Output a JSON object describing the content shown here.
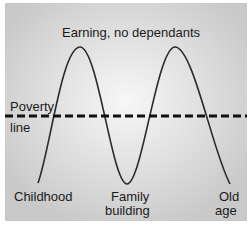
{
  "diagram": {
    "title_label": "Earning, no dependants",
    "threshold": {
      "line1": "Poverty",
      "line2": "line"
    },
    "stages": [
      {
        "line1": "Childhood",
        "line2": ""
      },
      {
        "line1": "Family",
        "line2": "building"
      },
      {
        "line1": "Old",
        "line2": "age"
      }
    ],
    "colors": {
      "curve": "#2a2a2a",
      "dashed_line": "#111111",
      "background": "#d8d8d8"
    }
  }
}
